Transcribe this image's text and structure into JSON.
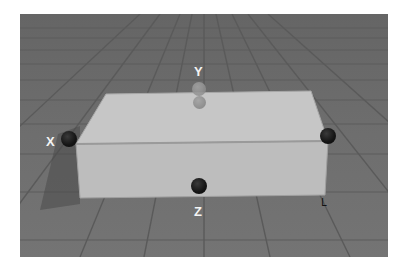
{
  "viewport": {
    "background": "#6f6f6f",
    "grid_color": "#5a5a5a"
  },
  "object": {
    "type": "box",
    "top_color": "#c6c6c6",
    "front_color": "#bdbdbd",
    "edge_color": "#9a9a9a"
  },
  "handles": [
    {
      "axis": "x",
      "label": "X",
      "color": "#141414"
    },
    {
      "axis": "x-opposite",
      "label": "",
      "color": "#141414"
    },
    {
      "axis": "y",
      "label": "Y",
      "color": "#9a9a9a"
    },
    {
      "axis": "z",
      "label": "Z",
      "color": "#141414"
    }
  ],
  "cursor": {
    "glyph": "L"
  }
}
